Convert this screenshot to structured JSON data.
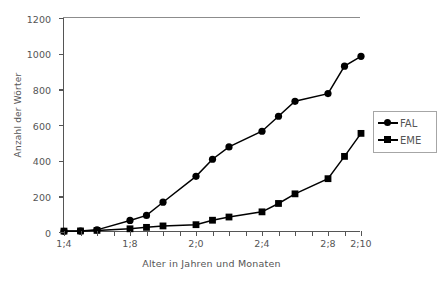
{
  "chart_data": {
    "type": "line",
    "title": "",
    "xlabel": "Alter in Jahren und Monaten",
    "ylabel": "Anzahl der Wörter",
    "x": [
      "1;4",
      "1;5",
      "1;6",
      "1;7",
      "1;8",
      "1;9",
      "1;10",
      "1;11",
      "2;0",
      "2;1",
      "2;2",
      "2;3",
      "2;4",
      "2;5",
      "2;6",
      "2;7",
      "2;8",
      "2;9",
      "2;10"
    ],
    "xtick_labels": [
      "1;4",
      "1;8",
      "2;0",
      "2;4",
      "2;8",
      "2;10"
    ],
    "xtick_positions": [
      0,
      4,
      8,
      12,
      16,
      18
    ],
    "ytick_labels": [
      "0",
      "200",
      "400",
      "600",
      "800",
      "1000",
      "1200"
    ],
    "ytick_values": [
      0,
      200,
      400,
      600,
      800,
      1000,
      1200
    ],
    "ylim": [
      0,
      1200
    ],
    "grid": false,
    "legend_position": "right",
    "series": [
      {
        "name": "FAL",
        "marker": "circle",
        "color": "#000000",
        "values": [
          4,
          5,
          12,
          65,
          93,
          167,
          312,
          408,
          477,
          565,
          649,
          733,
          776,
          930,
          985
        ],
        "x": [
          "1;4",
          "1;5",
          "1;6",
          "1;8",
          "1;9",
          "1;10",
          "2;0",
          "2;1",
          "2;2",
          "2;4",
          "2;5",
          "2;6",
          "2;8",
          "2;9",
          "2;10"
        ],
        "x_index": [
          0,
          1,
          2,
          4,
          5,
          6,
          8,
          9,
          10,
          12,
          13,
          14,
          16,
          17,
          18
        ]
      },
      {
        "name": "EME",
        "marker": "square",
        "color": "#000000",
        "values": [
          5,
          6,
          9,
          18,
          26,
          34,
          41,
          66,
          84,
          113,
          160,
          214,
          299,
          424,
          553
        ],
        "x": [
          "1;4",
          "1;5",
          "1;6",
          "1;8",
          "1;9",
          "1;10",
          "2;0",
          "2;1",
          "2;2",
          "2;4",
          "2;5",
          "2;6",
          "2;8",
          "2;9",
          "2;10"
        ],
        "x_index": [
          0,
          1,
          2,
          4,
          5,
          6,
          8,
          9,
          10,
          12,
          13,
          14,
          16,
          17,
          18
        ]
      }
    ]
  },
  "legend": {
    "entries": [
      {
        "label": "FAL",
        "marker": "circle-marker"
      },
      {
        "label": "EME",
        "marker": "square-marker"
      }
    ]
  },
  "colors": {
    "background": "#ffffff",
    "axis": "#555555",
    "series": "#000000",
    "legend_border": "#a6a6a6"
  }
}
